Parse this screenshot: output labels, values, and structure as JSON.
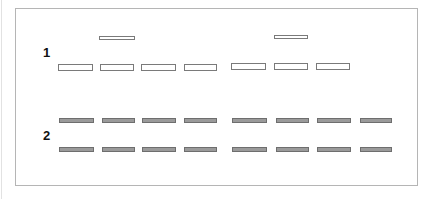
{
  "figure": {
    "groups": [
      {
        "label": "1",
        "label_pos": {
          "x": 43,
          "y": 46
        },
        "bands": [
          {
            "style": "thin",
            "x": 99,
            "y": 36,
            "w": 36
          },
          {
            "style": "thin",
            "x": 274,
            "y": 35,
            "w": 34
          },
          {
            "style": "open",
            "x": 58,
            "y": 64,
            "w": 35
          },
          {
            "style": "open",
            "x": 100,
            "y": 64,
            "w": 34
          },
          {
            "style": "open",
            "x": 141,
            "y": 64,
            "w": 35
          },
          {
            "style": "open",
            "x": 184,
            "y": 64,
            "w": 33
          },
          {
            "style": "open",
            "x": 231,
            "y": 63,
            "w": 35
          },
          {
            "style": "open",
            "x": 274,
            "y": 63,
            "w": 34
          },
          {
            "style": "open",
            "x": 316,
            "y": 63,
            "w": 34
          }
        ]
      },
      {
        "label": "2",
        "label_pos": {
          "x": 43,
          "y": 129
        },
        "bands": [
          {
            "style": "filled",
            "x": 59,
            "y": 118,
            "w": 35
          },
          {
            "style": "filled",
            "x": 102,
            "y": 118,
            "w": 33
          },
          {
            "style": "filled",
            "x": 142,
            "y": 118,
            "w": 34
          },
          {
            "style": "filled",
            "x": 184,
            "y": 118,
            "w": 33
          },
          {
            "style": "filled",
            "x": 232,
            "y": 118,
            "w": 35
          },
          {
            "style": "filled",
            "x": 276,
            "y": 118,
            "w": 33
          },
          {
            "style": "filled",
            "x": 317,
            "y": 118,
            "w": 34
          },
          {
            "style": "filled",
            "x": 360,
            "y": 118,
            "w": 32
          },
          {
            "style": "filled",
            "x": 59,
            "y": 147,
            "w": 35
          },
          {
            "style": "filled",
            "x": 102,
            "y": 147,
            "w": 33
          },
          {
            "style": "filled",
            "x": 142,
            "y": 147,
            "w": 34
          },
          {
            "style": "filled",
            "x": 184,
            "y": 147,
            "w": 33
          },
          {
            "style": "filled",
            "x": 232,
            "y": 147,
            "w": 35
          },
          {
            "style": "filled",
            "x": 276,
            "y": 147,
            "w": 33
          },
          {
            "style": "filled",
            "x": 317,
            "y": 147,
            "w": 34
          },
          {
            "style": "filled",
            "x": 360,
            "y": 147,
            "w": 32
          }
        ]
      }
    ],
    "colors": {
      "frame_border": "#b5b5b5",
      "band_outline": "#7a7a7a",
      "band_fill": "#9a9a9a"
    }
  }
}
